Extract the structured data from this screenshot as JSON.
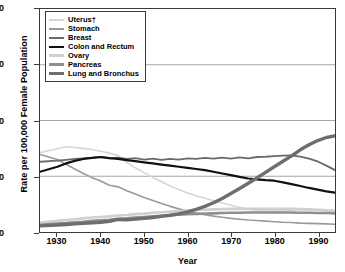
{
  "chart_data": {
    "type": "line",
    "title": "",
    "xlabel": "Year",
    "ylabel": "Rate per 100,000 Female Population",
    "xlim": [
      1926,
      1994
    ],
    "ylim": [
      0,
      80
    ],
    "xticks": [
      1930,
      1940,
      1950,
      1960,
      1970,
      1980,
      1990
    ],
    "yticks": [
      0,
      20,
      40,
      60,
      80
    ],
    "grid": "horizontal",
    "legend_position": "top-left",
    "series": [
      {
        "name": "Uterus†",
        "color": "#d5d5d5",
        "width": 1.6,
        "x": [
          1926,
          1930,
          1932,
          1934,
          1936,
          1938,
          1940,
          1942,
          1944,
          1946,
          1948,
          1950,
          1952,
          1954,
          1956,
          1958,
          1960,
          1962,
          1964,
          1966,
          1968,
          1970,
          1972,
          1974,
          1976,
          1978,
          1980,
          1982,
          1984,
          1986,
          1988,
          1990,
          1992,
          1994
        ],
        "values": [
          28.5,
          29.9,
          30.6,
          30.3,
          30.0,
          29.6,
          29.0,
          28.3,
          27.4,
          25.0,
          23.0,
          21.3,
          19.6,
          18.0,
          16.5,
          15.2,
          14.0,
          13.0,
          12.1,
          11.2,
          10.4,
          9.6,
          8.8,
          8.2,
          7.8,
          7.6,
          7.5,
          7.6,
          7.8,
          8.0,
          8.0,
          7.9,
          7.6,
          7.3
        ]
      },
      {
        "name": "Stomach",
        "color": "#9a9a9a",
        "width": 1.6,
        "x": [
          1926,
          1930,
          1932,
          1934,
          1936,
          1938,
          1940,
          1942,
          1944,
          1946,
          1948,
          1950,
          1952,
          1954,
          1956,
          1958,
          1960,
          1962,
          1964,
          1966,
          1968,
          1970,
          1972,
          1974,
          1976,
          1978,
          1980,
          1982,
          1984,
          1986,
          1988,
          1990,
          1992,
          1994
        ],
        "values": [
          27.8,
          26.0,
          24.3,
          22.6,
          21.0,
          19.5,
          18.3,
          16.8,
          16.2,
          14.8,
          13.6,
          12.4,
          11.3,
          10.2,
          9.2,
          8.3,
          7.5,
          6.8,
          6.2,
          5.7,
          5.3,
          4.9,
          4.6,
          4.3,
          4.1,
          3.9,
          3.7,
          3.5,
          3.4,
          3.2,
          3.1,
          3.0,
          2.9,
          2.8
        ]
      },
      {
        "name": "Breast",
        "color": "#6b6b6b",
        "width": 1.8,
        "x": [
          1926,
          1930,
          1932,
          1934,
          1936,
          1938,
          1940,
          1942,
          1944,
          1946,
          1948,
          1950,
          1952,
          1954,
          1956,
          1958,
          1960,
          1962,
          1964,
          1966,
          1968,
          1970,
          1972,
          1974,
          1976,
          1978,
          1980,
          1982,
          1984,
          1986,
          1988,
          1990,
          1992,
          1994
        ],
        "values": [
          25.2,
          25.6,
          25.9,
          26.2,
          26.4,
          26.6,
          26.9,
          26.4,
          26.7,
          26.2,
          26.5,
          26.0,
          26.3,
          25.9,
          26.2,
          26.0,
          26.4,
          26.2,
          26.6,
          26.3,
          26.7,
          26.3,
          26.8,
          26.4,
          26.9,
          27.0,
          27.2,
          27.4,
          27.5,
          27.0,
          26.3,
          25.3,
          23.8,
          22.2
        ]
      },
      {
        "name": "Colon and Rectum",
        "color": "#111111",
        "width": 2.2,
        "x": [
          1926,
          1930,
          1932,
          1934,
          1936,
          1938,
          1940,
          1942,
          1944,
          1946,
          1948,
          1950,
          1952,
          1954,
          1956,
          1958,
          1960,
          1962,
          1964,
          1966,
          1968,
          1970,
          1972,
          1974,
          1976,
          1978,
          1980,
          1982,
          1984,
          1986,
          1988,
          1990,
          1992,
          1994
        ],
        "values": [
          21.6,
          23.4,
          24.6,
          25.5,
          26.2,
          26.6,
          26.9,
          26.5,
          26.2,
          25.8,
          25.4,
          25.0,
          24.6,
          24.2,
          23.8,
          23.4,
          23.0,
          22.6,
          22.2,
          21.6,
          21.0,
          20.4,
          19.8,
          19.2,
          18.9,
          18.6,
          18.4,
          17.8,
          17.2,
          16.5,
          15.8,
          15.2,
          14.6,
          14.1
        ]
      },
      {
        "name": "Ovary",
        "color": "#d0d0d0",
        "width": 2.6,
        "x": [
          1926,
          1930,
          1932,
          1934,
          1936,
          1938,
          1940,
          1942,
          1944,
          1946,
          1948,
          1950,
          1952,
          1954,
          1956,
          1958,
          1960,
          1962,
          1964,
          1966,
          1968,
          1970,
          1972,
          1974,
          1976,
          1978,
          1980,
          1982,
          1984,
          1986,
          1988,
          1990,
          1992,
          1994
        ],
        "values": [
          3.4,
          4.0,
          4.3,
          4.6,
          4.9,
          5.2,
          5.4,
          5.6,
          5.9,
          6.1,
          6.4,
          6.6,
          6.9,
          7.1,
          7.3,
          7.5,
          7.7,
          7.9,
          8.0,
          8.1,
          8.2,
          8.3,
          8.3,
          8.3,
          8.3,
          8.3,
          8.3,
          8.3,
          8.3,
          8.2,
          8.1,
          8.0,
          7.8,
          7.7
        ]
      },
      {
        "name": "Pancreas",
        "color": "#8f8f8f",
        "width": 2.6,
        "x": [
          1926,
          1930,
          1932,
          1934,
          1936,
          1938,
          1940,
          1942,
          1944,
          1946,
          1948,
          1950,
          1952,
          1954,
          1956,
          1958,
          1960,
          1962,
          1964,
          1966,
          1968,
          1970,
          1972,
          1974,
          1976,
          1978,
          1980,
          1982,
          1984,
          1986,
          1988,
          1990,
          1992,
          1994
        ],
        "values": [
          2.6,
          3.0,
          3.2,
          3.5,
          3.7,
          4.0,
          4.2,
          4.4,
          4.7,
          4.9,
          5.2,
          5.4,
          5.6,
          5.8,
          6.0,
          6.2,
          6.4,
          6.5,
          6.6,
          6.7,
          6.8,
          6.9,
          6.9,
          7.0,
          7.0,
          7.0,
          7.0,
          7.0,
          7.0,
          6.9,
          6.9,
          6.8,
          6.8,
          6.7
        ]
      },
      {
        "name": "Lung and Bronchus",
        "color": "#6e6e6e",
        "width": 3.4,
        "x": [
          1926,
          1930,
          1932,
          1934,
          1936,
          1938,
          1940,
          1942,
          1944,
          1946,
          1948,
          1950,
          1952,
          1954,
          1956,
          1958,
          1960,
          1962,
          1964,
          1966,
          1968,
          1970,
          1972,
          1974,
          1976,
          1978,
          1980,
          1982,
          1984,
          1986,
          1988,
          1990,
          1992,
          1994
        ],
        "values": [
          2.2,
          2.5,
          2.7,
          2.9,
          3.1,
          3.3,
          3.5,
          3.8,
          4.5,
          4.4,
          4.6,
          4.9,
          5.2,
          5.6,
          6.0,
          6.5,
          7.2,
          8.1,
          9.2,
          10.5,
          12.0,
          13.8,
          15.6,
          17.5,
          19.4,
          21.4,
          23.4,
          25.4,
          27.3,
          29.5,
          31.3,
          32.8,
          33.9,
          34.5
        ]
      }
    ]
  },
  "legend": {
    "items": [
      {
        "label": "Uterus†"
      },
      {
        "label": "Stomach"
      },
      {
        "label": "Breast"
      },
      {
        "label": "Colon and Rectum"
      },
      {
        "label": "Ovary"
      },
      {
        "label": "Pancreas"
      },
      {
        "label": "Lung and Bronchus"
      }
    ]
  },
  "axes": {
    "x_title": "Year",
    "y_title": "Rate per 100,000 Female Population",
    "x_tick_labels": [
      "1930",
      "1940",
      "1950",
      "1960",
      "1970",
      "1980",
      "1990"
    ],
    "y_tick_labels": [
      "0",
      "20",
      "40",
      "60",
      "80"
    ]
  },
  "style": {
    "grid_color": "#808080",
    "frame_color": "#3a3a3a",
    "background": "#ffffff"
  }
}
